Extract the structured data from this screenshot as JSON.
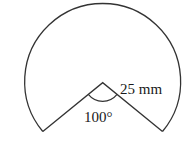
{
  "diagram": {
    "type": "circular-sector",
    "radius_label": "25 mm",
    "angle_label": "100°",
    "radius_value_mm": 25,
    "removed_angle_deg": 100,
    "stroke_color": "#333333"
  }
}
